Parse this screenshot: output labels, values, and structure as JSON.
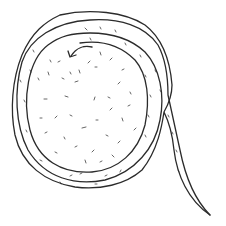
{
  "illustration": {
    "subject": "hand-drawn coiled ribbon spiral with trailing tail",
    "style": "black ink line drawing with stipple texture",
    "colors": {
      "background": "#ffffff",
      "ink": "#2b2b2b",
      "stipple": "#555555"
    },
    "elements": {
      "spiral": {
        "turns": 3,
        "direction": "clockwise outward"
      },
      "arrow": {
        "direction": "left",
        "position": "inner top of spiral"
      },
      "tail": {
        "exits": "right side",
        "ends": "bottom-right point"
      }
    }
  }
}
